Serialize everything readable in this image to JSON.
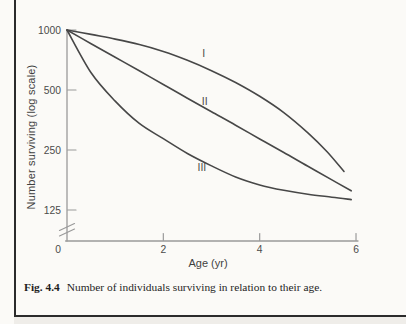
{
  "figure": {
    "number": "Fig. 4.4",
    "caption": "Number of individuals surviving in relation to their age."
  },
  "chart_data": {
    "type": "line",
    "title": "",
    "xlabel": "Age (yr)",
    "ylabel": "Number surviving (log scale)",
    "y_scale": "log",
    "xlim": [
      0,
      6
    ],
    "ylim_shown": [
      125,
      1000
    ],
    "x_ticks": [
      0,
      2,
      4,
      6
    ],
    "y_ticks": [
      1000,
      500,
      250,
      125
    ],
    "axis_break_below_y": 125,
    "grid": "off",
    "legend": "inline-labels",
    "series": [
      {
        "name": "I",
        "points": [
          [
            0,
            1000
          ],
          [
            0.5,
            950
          ],
          [
            1,
            900
          ],
          [
            1.5,
            845
          ],
          [
            2,
            780
          ],
          [
            2.5,
            705
          ],
          [
            3,
            625
          ],
          [
            3.5,
            545
          ],
          [
            4,
            465
          ],
          [
            4.5,
            385
          ],
          [
            5,
            305
          ],
          [
            5.4,
            245
          ],
          [
            5.75,
            195
          ]
        ]
      },
      {
        "name": "II",
        "points": [
          [
            0,
            1000
          ],
          [
            0.5,
            854
          ],
          [
            1,
            730
          ],
          [
            1.5,
            624
          ],
          [
            2,
            533
          ],
          [
            2.5,
            455
          ],
          [
            3,
            389
          ],
          [
            3.5,
            333
          ],
          [
            4,
            284
          ],
          [
            4.5,
            243
          ],
          [
            5,
            207
          ],
          [
            5.5,
            177
          ],
          [
            5.9,
            156
          ]
        ]
      },
      {
        "name": "III",
        "points": [
          [
            0,
            1000
          ],
          [
            0.5,
            610
          ],
          [
            1,
            440
          ],
          [
            1.5,
            340
          ],
          [
            2,
            285
          ],
          [
            2.5,
            240
          ],
          [
            3,
            208
          ],
          [
            3.5,
            183
          ],
          [
            4,
            167
          ],
          [
            4.5,
            157
          ],
          [
            5,
            150
          ],
          [
            5.5,
            145
          ],
          [
            5.9,
            141
          ]
        ]
      }
    ],
    "series_labels": [
      {
        "text": "I",
        "age": 2.84,
        "value": 760
      },
      {
        "text": "II",
        "age": 2.86,
        "value": 440
      },
      {
        "text": "III",
        "age": 2.8,
        "value": 205
      }
    ],
    "colors": {
      "curve": "#474747",
      "axis": "#9a9a9a",
      "tick_text": "#4a4a4a",
      "page_border": "#2b2b2b"
    }
  }
}
